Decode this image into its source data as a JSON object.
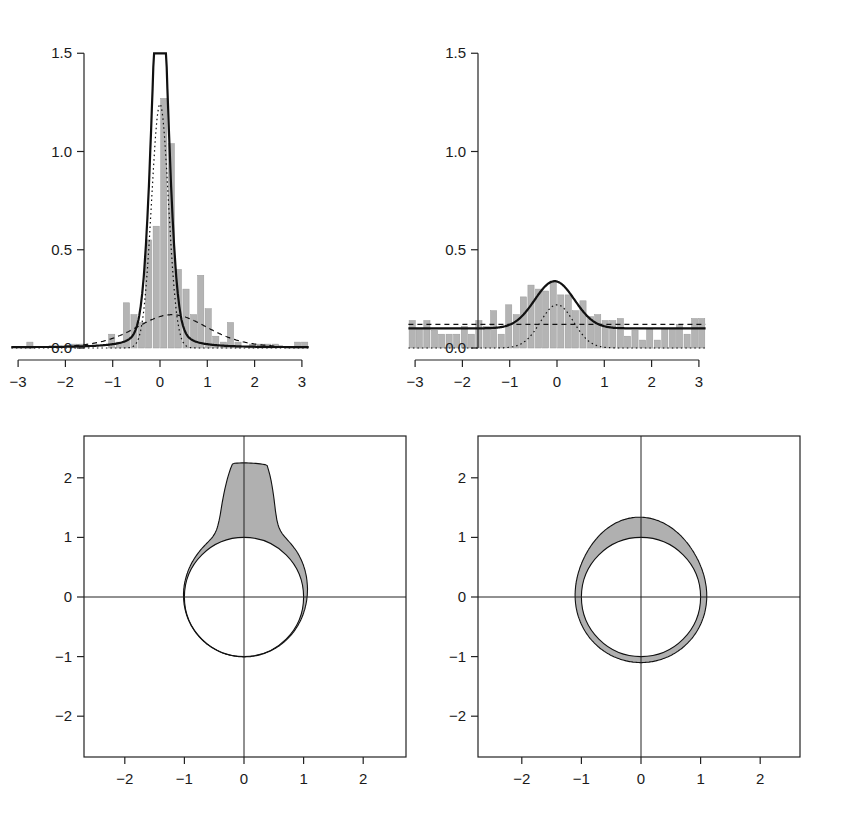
{
  "colors": {
    "bar_fill": "#b4b4b4",
    "bar_stroke": "#9a9a9a",
    "line": "#111111",
    "ring_fill": "#b0b0b0",
    "axis": "#222222"
  },
  "chart_data": [
    {
      "id": "top-left",
      "type": "bar",
      "title": "",
      "xlabel": "",
      "ylabel": "",
      "xlim": [
        -3.1416,
        3.1416
      ],
      "ylim": [
        0,
        1.5
      ],
      "x_ticks": [
        "-3",
        "-2",
        "-1",
        "0",
        "1",
        "2",
        "3"
      ],
      "y_ticks": [
        "0.0",
        "0.5",
        "1.0",
        "1.5"
      ],
      "grid": false,
      "bin_width": 0.157,
      "bin_centers": [
        -3.06,
        -2.91,
        -2.75,
        -2.59,
        -2.44,
        -2.28,
        -2.12,
        -1.96,
        -1.81,
        -1.65,
        -1.49,
        -1.34,
        -1.18,
        -1.02,
        -0.86,
        -0.71,
        -0.55,
        -0.39,
        -0.24,
        -0.08,
        0.08,
        0.24,
        0.39,
        0.55,
        0.71,
        0.86,
        1.02,
        1.18,
        1.34,
        1.49,
        1.65,
        1.81,
        1.96,
        2.12,
        2.28,
        2.44,
        2.59,
        2.75,
        2.91,
        3.06
      ],
      "values": [
        0,
        0,
        0.03,
        0,
        0,
        0,
        0,
        0,
        0.02,
        0.02,
        0,
        0,
        0,
        0.07,
        0.03,
        0.23,
        0.17,
        0.13,
        0.55,
        0.62,
        1.27,
        1.04,
        0.4,
        0.3,
        0.17,
        0.37,
        0.2,
        0.06,
        0.03,
        0.13,
        0.03,
        0,
        0.02,
        0.02,
        0.02,
        0.02,
        0,
        0,
        0.03,
        0.03
      ],
      "series": [
        {
          "name": "mixture density (solid)",
          "style": "solid",
          "peak": 1.25,
          "peak_x": 0.0
        },
        {
          "name": "concentrated component (dotted)",
          "style": "dotted",
          "peak": 0.92,
          "peak_x": 0.0
        },
        {
          "name": "diffuse component (dashed)",
          "style": "dashed",
          "peak": 0.33,
          "peak_x": 0.25
        }
      ]
    },
    {
      "id": "top-right",
      "type": "bar",
      "title": "",
      "xlabel": "",
      "ylabel": "",
      "xlim": [
        -3.1416,
        3.1416
      ],
      "ylim": [
        0,
        1.5
      ],
      "x_ticks": [
        "-3",
        "-2",
        "-1",
        "0",
        "1",
        "2",
        "3"
      ],
      "y_ticks": [
        "0.0",
        "0.5",
        "1.0",
        "1.5"
      ],
      "grid": false,
      "bin_width": 0.157,
      "bin_centers": [
        -3.06,
        -2.91,
        -2.75,
        -2.59,
        -2.44,
        -2.28,
        -2.12,
        -1.96,
        -1.81,
        -1.65,
        -1.49,
        -1.34,
        -1.18,
        -1.02,
        -0.86,
        -0.71,
        -0.55,
        -0.39,
        -0.24,
        -0.08,
        0.08,
        0.24,
        0.39,
        0.55,
        0.71,
        0.86,
        1.02,
        1.18,
        1.34,
        1.49,
        1.65,
        1.81,
        1.96,
        2.12,
        2.28,
        2.44,
        2.59,
        2.75,
        2.91,
        3.06
      ],
      "values": [
        0.14,
        0.1,
        0.14,
        0.09,
        0.07,
        0.07,
        0.07,
        0.11,
        0.07,
        0.14,
        0.11,
        0.19,
        0.07,
        0.22,
        0.17,
        0.26,
        0.32,
        0.3,
        0.29,
        0.34,
        0.27,
        0.27,
        0.19,
        0.24,
        0.16,
        0.17,
        0.14,
        0.14,
        0.15,
        0.06,
        0.09,
        0.04,
        0.1,
        0.04,
        0.1,
        0.1,
        0.12,
        0.07,
        0.15,
        0.15
      ],
      "series": [
        {
          "name": "mixture density (solid)",
          "style": "solid",
          "peak": 0.34,
          "peak_x": -0.05,
          "baseline": 0.1
        },
        {
          "name": "uniform-like component (dashed)",
          "style": "dashed",
          "level": 0.12
        },
        {
          "name": "concentrated component (dotted)",
          "style": "dotted",
          "peak": 0.22,
          "peak_x": 0.0
        }
      ]
    },
    {
      "id": "bottom-left",
      "type": "area",
      "title": "",
      "description": "Circular density plot: unit circle with shaded band of radius 1 + density(θ), θ measured from +y axis",
      "xlim": [
        -2.7,
        2.7
      ],
      "ylim": [
        -2.7,
        2.7
      ],
      "x_ticks": [
        "-2",
        "-1",
        "0",
        "1",
        "2"
      ],
      "y_ticks": [
        "-2",
        "-1",
        "0",
        "1",
        "2"
      ],
      "grid": false,
      "reference_circle_radius": 1,
      "max_outer_radius": 2.25,
      "source": "top-left density"
    },
    {
      "id": "bottom-right",
      "type": "area",
      "title": "",
      "description": "Circular density plot: unit circle with shaded band of radius 1 + density(θ), θ measured from +y axis",
      "xlim": [
        -2.7,
        2.7
      ],
      "ylim": [
        -2.7,
        2.7
      ],
      "x_ticks": [
        "-2",
        "-1",
        "0",
        "1",
        "2"
      ],
      "y_ticks": [
        "-2",
        "-1",
        "0",
        "1",
        "2"
      ],
      "grid": false,
      "reference_circle_radius": 1,
      "max_outer_radius": 1.34,
      "source": "top-right density"
    }
  ]
}
